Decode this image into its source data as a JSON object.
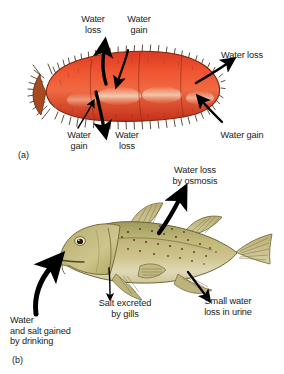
{
  "figure": {
    "background_color": "#ffffff",
    "text_color": "#1a1a1a"
  },
  "panels": [
    {
      "tag": "(a)",
      "subject": "sea-cucumber",
      "organism_colors": {
        "body": "#e8452a",
        "body_light": "#f0e2c8",
        "body_dark": "#b02a18",
        "spines": "#4a2c12"
      },
      "labels": [
        {
          "name": "water-loss-top-left",
          "text": "Water\nloss"
        },
        {
          "name": "water-gain-top-mid",
          "text": "Water\ngain"
        },
        {
          "name": "water-loss-right",
          "text": "Water loss"
        },
        {
          "name": "water-gain-bottom-left",
          "text": "Water\ngain"
        },
        {
          "name": "water-loss-bottom-mid",
          "text": "Water\nloss"
        },
        {
          "name": "water-gain-bottom-right",
          "text": "Water gain"
        }
      ]
    },
    {
      "tag": "(b)",
      "subject": "marine-bony-fish",
      "organism_colors": {
        "body": "#c9c089",
        "body_dark": "#8f8a50",
        "belly": "#e3ddc0",
        "fins": "#b5a96e",
        "speckles": "#4a3c20"
      },
      "labels": [
        {
          "name": "water-loss-by-osmosis",
          "text": "Water loss\nby osmosis"
        },
        {
          "name": "salt-excreted-by-gills",
          "text": "Salt excreted\nby gills"
        },
        {
          "name": "small-water-loss-in-urine",
          "text": "Small water\nloss in urine"
        },
        {
          "name": "water-and-salt-gained-by-drinking",
          "text": "Water\nand salt gained\nby drinking"
        }
      ]
    }
  ]
}
